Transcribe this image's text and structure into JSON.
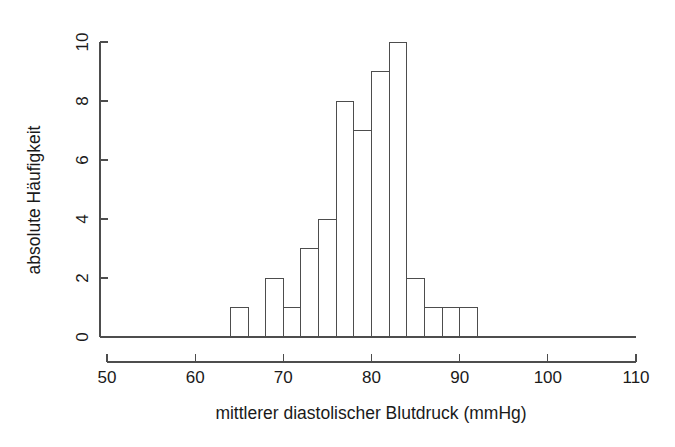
{
  "chart_data": {
    "type": "bar",
    "title": "",
    "subtitle": "",
    "xlabel": "mittlerer diastolischer Blutdruck (mmHg)",
    "ylabel": "absolute Häufigkeit",
    "xlim": [
      50,
      110
    ],
    "ylim": [
      0,
      10
    ],
    "grid": false,
    "legend": false,
    "bin_width": 2,
    "x_ticks": [
      50,
      60,
      70,
      80,
      90,
      100,
      110
    ],
    "x_tick_labels": [
      "50",
      "60",
      "70",
      "80",
      "90",
      "100",
      "110"
    ],
    "y_ticks": [
      0,
      2,
      4,
      6,
      8,
      10
    ],
    "y_tick_labels": [
      "0",
      "2",
      "4",
      "6",
      "8",
      "10"
    ],
    "bins": [
      {
        "start": 64,
        "end": 66,
        "count": 1
      },
      {
        "start": 66,
        "end": 68,
        "count": 0
      },
      {
        "start": 68,
        "end": 70,
        "count": 2
      },
      {
        "start": 70,
        "end": 72,
        "count": 1
      },
      {
        "start": 72,
        "end": 74,
        "count": 3
      },
      {
        "start": 74,
        "end": 76,
        "count": 4
      },
      {
        "start": 76,
        "end": 78,
        "count": 8
      },
      {
        "start": 78,
        "end": 80,
        "count": 7
      },
      {
        "start": 80,
        "end": 82,
        "count": 9
      },
      {
        "start": 82,
        "end": 84,
        "count": 10
      },
      {
        "start": 84,
        "end": 86,
        "count": 2
      },
      {
        "start": 86,
        "end": 88,
        "count": 1
      },
      {
        "start": 88,
        "end": 90,
        "count": 1
      },
      {
        "start": 90,
        "end": 92,
        "count": 1
      }
    ],
    "categories": [
      "64-66",
      "66-68",
      "68-70",
      "70-72",
      "72-74",
      "74-76",
      "76-78",
      "78-80",
      "80-82",
      "82-84",
      "84-86",
      "86-88",
      "88-90",
      "90-92"
    ],
    "values": [
      1,
      0,
      2,
      1,
      3,
      4,
      8,
      7,
      9,
      10,
      2,
      1,
      1,
      1
    ],
    "total_count": 50,
    "colors": {
      "background": "#ffffff",
      "axis": "#4d4d4d",
      "bar_stroke": "#4d4d4d",
      "bar_fill": "none",
      "text": "#1a1a1a"
    }
  }
}
